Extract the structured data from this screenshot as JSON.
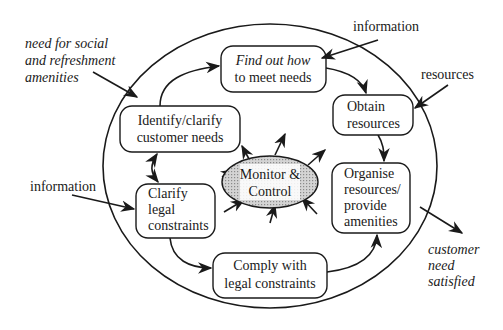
{
  "diagram": {
    "type": "process-cycle",
    "boundary": "system-ellipse",
    "center": {
      "label_lines": [
        "Monitor &",
        "Control"
      ],
      "fill": "#bdbdbd"
    },
    "processes": [
      {
        "id": "identify",
        "lines": [
          "Identify/clarify",
          "customer needs"
        ],
        "italic": false
      },
      {
        "id": "findout",
        "lines": [
          "Find out how",
          "to meet needs"
        ],
        "italic_first_line": true
      },
      {
        "id": "obtain",
        "lines": [
          "Obtain",
          "resources"
        ],
        "italic": false
      },
      {
        "id": "organise",
        "lines": [
          "Organise",
          "resources/",
          "provide",
          "amenities"
        ],
        "italic": false
      },
      {
        "id": "comply",
        "lines": [
          "Comply with",
          "legal constraints"
        ],
        "italic": false
      },
      {
        "id": "clarify",
        "lines": [
          "Clarify",
          "legal",
          "constraints"
        ],
        "italic": false
      }
    ],
    "flows": [
      {
        "from": "identify",
        "to": "findout"
      },
      {
        "from": "findout",
        "to": "obtain"
      },
      {
        "from": "obtain",
        "to": "organise"
      },
      {
        "from": "clarify",
        "to": "comply"
      },
      {
        "from": "comply",
        "to": "organise"
      },
      {
        "from": "identify",
        "to": "clarify",
        "bidirectional": true
      }
    ],
    "external_inputs": [
      {
        "lines": [
          "need for social",
          "and refreshment",
          "amenities"
        ],
        "italic": true,
        "target": "identify"
      },
      {
        "lines": [
          "information"
        ],
        "italic": false,
        "target": "findout"
      },
      {
        "lines": [
          "resources"
        ],
        "italic": false,
        "target": "obtain"
      },
      {
        "lines": [
          "information"
        ],
        "italic": false,
        "target": "clarify"
      }
    ],
    "external_outputs": [
      {
        "lines": [
          "customer",
          "need",
          "satisfied"
        ],
        "italic": true,
        "source": "organise"
      }
    ]
  }
}
